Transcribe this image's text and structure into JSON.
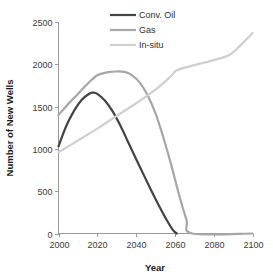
{
  "chart_data": {
    "type": "line",
    "title": "",
    "xlabel": "Year",
    "ylabel": "Number of New Wells",
    "xlim": [
      2000,
      2100
    ],
    "ylim": [
      0,
      2500
    ],
    "xticks": [
      2000,
      2020,
      2040,
      2060,
      2080,
      2100
    ],
    "yticks": [
      0,
      500,
      1000,
      1500,
      2000,
      2500
    ],
    "xtick_labels": [
      "2000",
      "2020",
      "2040",
      "2060",
      "2080",
      "2100"
    ],
    "ytick_labels": [
      "0",
      "500",
      "1000",
      "1500",
      "2000",
      "2500"
    ],
    "grid": false,
    "legend_position": "top-center",
    "series": [
      {
        "name": "Conv. Oil",
        "color": "#434343",
        "width": 2.2,
        "x": [
          2000,
          2004,
          2008,
          2012,
          2016,
          2018,
          2020,
          2024,
          2028,
          2032,
          2036,
          2040,
          2044,
          2048,
          2052,
          2056,
          2059,
          2061
        ],
        "values": [
          1030,
          1270,
          1450,
          1580,
          1655,
          1665,
          1650,
          1570,
          1440,
          1270,
          1075,
          880,
          690,
          500,
          320,
          150,
          40,
          0
        ]
      },
      {
        "name": "Gas",
        "color": "#a6a6a6",
        "width": 2.2,
        "x": [
          2000,
          2005,
          2010,
          2015,
          2020,
          2025,
          2030,
          2034,
          2038,
          2042,
          2046,
          2050,
          2054,
          2058,
          2062,
          2066,
          2069,
          2100
        ],
        "values": [
          1400,
          1530,
          1650,
          1770,
          1870,
          1905,
          1915,
          1910,
          1870,
          1780,
          1630,
          1420,
          1140,
          820,
          470,
          160,
          0,
          0
        ]
      },
      {
        "name": "In-situ",
        "color": "#cfcfcf",
        "width": 2.2,
        "x": [
          2000,
          2010,
          2020,
          2030,
          2040,
          2050,
          2058,
          2061,
          2070,
          2080,
          2088,
          2094,
          2100
        ],
        "values": [
          960,
          1100,
          1240,
          1390,
          1540,
          1700,
          1860,
          1930,
          1990,
          2050,
          2110,
          2230,
          2370
        ]
      }
    ]
  },
  "legend": {
    "items": [
      {
        "label": "Conv. Oil",
        "color": "#434343"
      },
      {
        "label": "Gas",
        "color": "#a6a6a6"
      },
      {
        "label": "In-situ",
        "color": "#cfcfcf"
      }
    ]
  },
  "axes": {
    "x_title": "Year",
    "y_title": "Number of New Wells"
  }
}
